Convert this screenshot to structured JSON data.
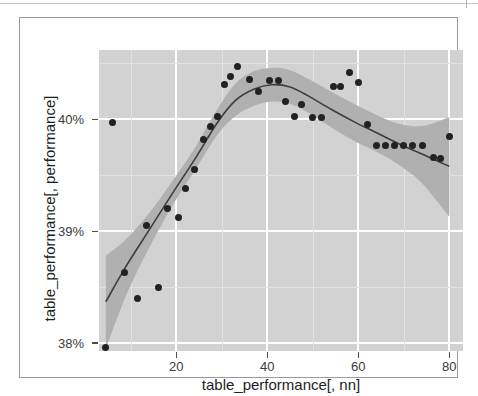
{
  "figure": {
    "background_color": "#ffffff",
    "frame_color": "#9a9a9a",
    "panel_color": "#d2d2d2",
    "grid_color": "#ffffff",
    "ribbon_color": "#b0b0b0",
    "line_color": "#3d3d3d",
    "point_color": "#222222"
  },
  "chart_data": {
    "type": "scatter",
    "title": "",
    "subtitle": "",
    "xlabel": "table_performance[, nn]",
    "ylabel": "table_performance[, performance]",
    "xlim": [
      3,
      83
    ],
    "ylim": [
      37.93,
      40.62
    ],
    "xticks": [
      20,
      40,
      60,
      80
    ],
    "xticklabels": [
      "20",
      "40",
      "60",
      "80"
    ],
    "yticks": [
      38,
      39,
      40
    ],
    "yticklabels": [
      "38%",
      "39%",
      "40%"
    ],
    "grid": true,
    "legend": false,
    "legend_position": "none",
    "series": [
      {
        "name": "observations",
        "type": "scatter",
        "x": [
          4.5,
          6.0,
          8.5,
          11.5,
          13.5,
          16.0,
          18.0,
          20.5,
          22.0,
          24.0,
          26.0,
          27.5,
          29.0,
          30.5,
          32.0,
          33.5,
          36.0,
          38.0,
          40.5,
          42.5,
          44.0,
          46.0,
          47.5,
          50.0,
          52.0,
          54.5,
          56.0,
          58.0,
          60.0,
          62.0,
          64.0,
          66.0,
          68.0,
          70.0,
          72.0,
          74.0,
          76.5,
          78.0,
          80.0
        ],
        "y": [
          37.96,
          39.97,
          38.63,
          38.4,
          39.05,
          38.5,
          39.2,
          39.12,
          39.38,
          39.55,
          39.82,
          39.94,
          40.03,
          40.31,
          40.38,
          40.47,
          40.36,
          40.25,
          40.35,
          40.35,
          40.16,
          40.03,
          40.13,
          40.02,
          40.02,
          40.29,
          40.29,
          40.42,
          40.33,
          39.95,
          39.77,
          39.77,
          39.77,
          39.77,
          39.77,
          39.77,
          39.66,
          39.65,
          39.85
        ]
      },
      {
        "name": "loess-fit",
        "type": "line",
        "x": [
          4.5,
          9,
          14,
          19,
          24,
          29,
          33,
          37,
          41,
          45,
          49,
          54,
          59,
          64,
          69,
          74,
          80
        ],
        "y": [
          38.37,
          38.69,
          39.01,
          39.33,
          39.64,
          39.97,
          40.17,
          40.27,
          40.31,
          40.29,
          40.21,
          40.09,
          39.98,
          39.88,
          39.78,
          39.69,
          39.58
        ]
      },
      {
        "name": "confidence-band",
        "type": "area",
        "x": [
          4.5,
          9,
          14,
          19,
          24,
          29,
          33,
          37,
          41,
          45,
          49,
          54,
          59,
          64,
          69,
          74,
          80
        ],
        "y_upper": [
          38.78,
          38.93,
          39.16,
          39.44,
          39.74,
          40.09,
          40.32,
          40.43,
          40.46,
          40.44,
          40.36,
          40.25,
          40.14,
          40.04,
          39.96,
          39.94,
          40.02
        ],
        "y_lower": [
          37.95,
          38.43,
          38.85,
          39.22,
          39.54,
          39.86,
          40.03,
          40.12,
          40.16,
          40.14,
          40.06,
          39.93,
          39.81,
          39.71,
          39.59,
          39.43,
          39.13
        ]
      }
    ]
  }
}
